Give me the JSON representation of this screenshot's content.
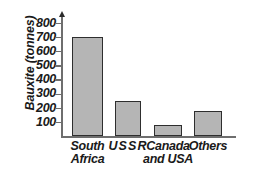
{
  "chart_data": {
    "type": "bar",
    "title": "",
    "xlabel": "",
    "ylabel": "Bauxite (tonnes)",
    "categories": [
      "South Africa",
      "USSR",
      "Canada and USA",
      "Others"
    ],
    "values": [
      700,
      250,
      80,
      175
    ],
    "ylim": [
      0,
      850
    ],
    "ytick_labels": [
      "800",
      "700",
      "600",
      "500",
      "400",
      "300",
      "200",
      "100"
    ],
    "ytick_values": [
      800,
      700,
      600,
      500,
      400,
      300,
      200,
      100
    ],
    "grid": false,
    "legend": null,
    "bar_fill_color": "#b5b5b5",
    "bar_border_color": "#2e2e2e",
    "axis_color": "#6e6e6e",
    "text_color": "#1a1a1a",
    "background_color": "#ffffff"
  },
  "axis": {
    "y_title": "Bauxite (tonnes)",
    "arrow_icon": "axis-arrow-up-icon"
  },
  "categories_display": [
    {
      "line1": "South",
      "line2": "Africa",
      "full": "South Africa"
    },
    {
      "line1": "USSR",
      "line2": "",
      "full": "USSR"
    },
    {
      "line1": "Canada",
      "line2": "and USA",
      "full": "Canada and USA"
    },
    {
      "line1": "Others",
      "line2": "",
      "full": "Others"
    }
  ]
}
